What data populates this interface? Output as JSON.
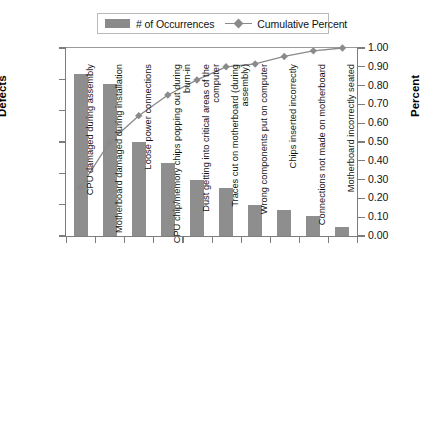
{
  "chart_data": {
    "type": "bar",
    "title": "",
    "subtitle": "",
    "xlabel": "",
    "ylabel": "Defects",
    "ylabel_right": "Percent",
    "ylim": [
      0,
      300
    ],
    "ylim_right": [
      0.0,
      1.0
    ],
    "yticks": [
      0,
      50,
      100,
      150,
      200,
      250,
      300
    ],
    "yticks_right": [
      "0.00",
      "0.10",
      "0.20",
      "0.30",
      "0.40",
      "0.50",
      "0.60",
      "0.70",
      "0.80",
      "0.90",
      "1.00"
    ],
    "grid": false,
    "legend_position": "top",
    "categories": [
      "CPU damaged during assembly",
      "Motherboard damaged during installation",
      "Loose power connections",
      "CPU chip/memory chips popping out during burn-in",
      "Dust getting into critical areas of the computer",
      "Traces cut on motherboard (during assembly)",
      "Wrong components put on computer",
      "Chips inserted incorrectly",
      "Connections not made on motherboard",
      "Motherboard incorrectly seated"
    ],
    "series": [
      {
        "name": "# of Occurrences",
        "type": "bar",
        "axis": "left",
        "color": "#8e8e8e",
        "values": [
          258,
          243,
          150,
          116,
          90,
          77,
          50,
          42,
          32,
          14
        ]
      },
      {
        "name": "Cumulative Percent",
        "type": "line",
        "axis": "right",
        "color": "#8a8a8a",
        "values": [
          0.26,
          0.5,
          0.64,
          0.75,
          0.83,
          0.9,
          0.915,
          0.955,
          0.985,
          1.0
        ]
      }
    ]
  },
  "legend": {
    "items": [
      {
        "label": "# of Occurrences",
        "marker": "bar-swatch-icon"
      },
      {
        "label": "Cumulative Percent",
        "marker": "line-marker-icon"
      }
    ]
  },
  "axes": {
    "left_title": "Defects",
    "right_title": "Percent"
  }
}
